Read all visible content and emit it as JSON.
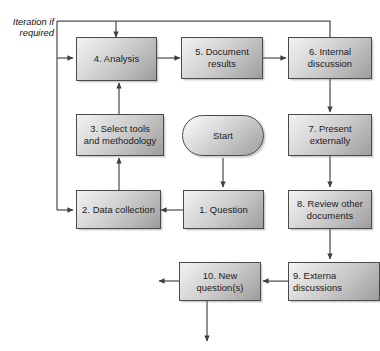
{
  "diagram": {
    "title_caption": "Iteration if\nrequired",
    "caption_line1": "Iteration if",
    "caption_line2": "required",
    "colors": {
      "node_border": "#4a4a4a",
      "node_fill_light": "#f2f2f2",
      "node_fill_dark": "#9d9d9d",
      "connector": "#4f4f4f",
      "text": "#1a1a1a",
      "background": "#ffffff"
    },
    "nodes": [
      {
        "id": "start",
        "shape": "terminator",
        "label_line1": "Start",
        "label_line2": ""
      },
      {
        "id": "n1",
        "shape": "process",
        "label_line1": "1. Question",
        "label_line2": ""
      },
      {
        "id": "n2",
        "shape": "process",
        "label_line1": "2. Data collection",
        "label_line2": ""
      },
      {
        "id": "n3",
        "shape": "process",
        "label_line1": "3. Select tools",
        "label_line2": "and methodology"
      },
      {
        "id": "n4",
        "shape": "process",
        "label_line1": "4. Analysis",
        "label_line2": ""
      },
      {
        "id": "n5",
        "shape": "process",
        "label_line1": "5. Document",
        "label_line2": "results"
      },
      {
        "id": "n6",
        "shape": "process",
        "label_line1": "6. Internal",
        "label_line2": "discussion"
      },
      {
        "id": "n7",
        "shape": "process",
        "label_line1": "7. Present",
        "label_line2": "externally"
      },
      {
        "id": "n8",
        "shape": "process",
        "label_line1": "8. Review other",
        "label_line2": "documents"
      },
      {
        "id": "n9",
        "shape": "process",
        "label_line1": "9. Externa",
        "label_line2": "discussions"
      },
      {
        "id": "n10",
        "shape": "process",
        "label_line1": "10. New",
        "label_line2": "question(s)"
      }
    ],
    "flow_order": [
      "Start",
      "1. Question",
      "2. Data collection",
      "3. Select tools and methodology",
      "4. Analysis",
      "5. Document results",
      "6. Internal discussion",
      "7. Present externally",
      "8. Review other documents",
      "9. External discussions",
      "10. New question(s)"
    ]
  }
}
